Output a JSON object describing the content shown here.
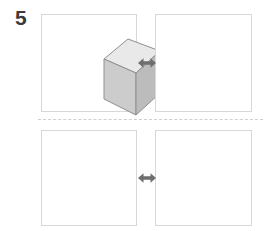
{
  "question": {
    "number": "5"
  },
  "colors": {
    "background": "#ffffff",
    "panel_border": "#d8d8d8",
    "divider": "#cfcfcf",
    "arrow": "#6e6e6e",
    "shape_outline": "#8f8f8f",
    "face_top": "#e8e8e8",
    "face_front": "#c9c9c9",
    "face_side": "#bdbdbd",
    "number_text": "#3b3b3b"
  },
  "panels": [
    {
      "id": "top-left",
      "position": "top-left",
      "content": "rectangular-prism",
      "shape_label": "rectangular prism",
      "empty": false
    },
    {
      "id": "top-right",
      "position": "top-right",
      "content": "empty",
      "shape_label": "",
      "empty": true
    },
    {
      "id": "bottom-left",
      "position": "bottom-left",
      "content": "small-cylinder",
      "shape_label": "small cylinder",
      "empty": false
    },
    {
      "id": "bottom-right",
      "position": "bottom-right",
      "content": "large-cylinder",
      "shape_label": "large cylinder",
      "empty": false
    }
  ],
  "arrows": [
    {
      "id": "arrow-top",
      "icon": "double-arrow-horizontal-icon"
    },
    {
      "id": "arrow-bottom",
      "icon": "double-arrow-horizontal-icon"
    }
  ],
  "divider": {
    "style": "dashed",
    "orientation": "horizontal"
  }
}
